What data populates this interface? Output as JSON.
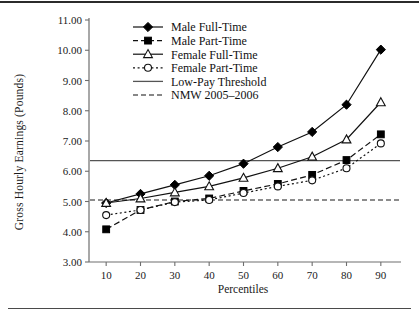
{
  "figure": {
    "ylabel": "Gross Hourly Earnings (Pounds)",
    "xlabel": "Percentiles"
  },
  "axes": {
    "y_ticks": [
      "11.00",
      "10.00",
      "9.00",
      "8.00",
      "7.00",
      "6.00",
      "5.00",
      "4.00",
      "3.00"
    ],
    "x_ticks": [
      "10",
      "20",
      "30",
      "40",
      "50",
      "60",
      "70",
      "80",
      "90"
    ]
  },
  "legend": {
    "items": [
      {
        "label": "Male Full-Time",
        "marker": "filled-diamond",
        "line": "solid"
      },
      {
        "label": "Male Part-Time",
        "marker": "filled-square",
        "line": "dashed"
      },
      {
        "label": "Female Full-Time",
        "marker": "open-triangle",
        "line": "solid"
      },
      {
        "label": "Female Part-Time",
        "marker": "open-circle",
        "line": "dotted"
      },
      {
        "label": "Low-Pay Threshold",
        "marker": "none",
        "line": "solid"
      },
      {
        "label": "NMW 2005–2006",
        "marker": "none",
        "line": "dashed"
      }
    ]
  },
  "colors": {
    "ink": "#1a1a1a",
    "axis": "#6e6e6e",
    "series": "#111111",
    "threshold": "#555555"
  },
  "chart_data": {
    "type": "line",
    "title": "",
    "xlabel": "Percentiles",
    "ylabel": "Gross Hourly Earnings (Pounds)",
    "xlim": [
      5,
      95
    ],
    "ylim": [
      3.0,
      11.0
    ],
    "ytick_step": 1.0,
    "grid": false,
    "legend_position": "top-center-inside",
    "x": [
      10,
      20,
      30,
      40,
      50,
      60,
      70,
      80,
      90
    ],
    "categories": [
      "10",
      "20",
      "30",
      "40",
      "50",
      "60",
      "70",
      "80",
      "90"
    ],
    "series": [
      {
        "name": "Male Full-Time",
        "marker": "filled-diamond",
        "line": "solid",
        "values": [
          4.95,
          5.25,
          5.55,
          5.85,
          6.25,
          6.8,
          7.3,
          8.2,
          10.02
        ]
      },
      {
        "name": "Male Part-Time",
        "marker": "filled-square",
        "line": "dashed",
        "values": [
          4.08,
          4.72,
          5.0,
          5.1,
          5.35,
          5.58,
          5.88,
          6.37,
          7.22
        ]
      },
      {
        "name": "Female Full-Time",
        "marker": "open-triangle",
        "line": "solid",
        "values": [
          4.95,
          5.1,
          5.3,
          5.5,
          5.78,
          6.1,
          6.48,
          7.05,
          8.28
        ]
      },
      {
        "name": "Female Part-Time",
        "marker": "open-circle",
        "line": "dotted",
        "values": [
          4.55,
          4.72,
          4.98,
          5.05,
          5.28,
          5.5,
          5.7,
          6.1,
          6.92
        ]
      }
    ],
    "reference_lines": [
      {
        "name": "Low-Pay Threshold",
        "value": 6.35,
        "line": "solid",
        "orientation": "horizontal"
      },
      {
        "name": "NMW 2005–2006",
        "value": 5.05,
        "line": "dashed",
        "orientation": "horizontal"
      }
    ]
  }
}
